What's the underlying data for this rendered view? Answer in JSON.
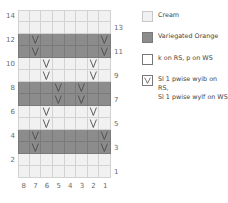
{
  "chart_data": {
    "type": "table",
    "columns": [
      8,
      7,
      6,
      5,
      4,
      3,
      2,
      1
    ],
    "rows_left_labels": [
      14,
      12,
      10,
      8,
      6,
      4,
      2
    ],
    "rows_right_labels": [
      13,
      11,
      9,
      7,
      5,
      3,
      1
    ],
    "row_colors": {
      "1": "cream",
      "2": "cream",
      "3": "orange",
      "4": "orange",
      "5": "cream",
      "6": "cream",
      "7": "orange",
      "8": "orange",
      "9": "cream",
      "10": "cream",
      "11": "orange",
      "12": "orange",
      "13": "cream",
      "14": "cream"
    },
    "slip_stitches": {
      "3": [
        7,
        1
      ],
      "4": [
        7,
        1
      ],
      "5": [
        6,
        2
      ],
      "6": [
        6,
        2
      ],
      "7": [
        5,
        3
      ],
      "8": [
        5,
        3
      ],
      "9": [
        6,
        2
      ],
      "10": [
        6,
        2
      ],
      "11": [
        7,
        1
      ],
      "12": [
        7,
        1
      ]
    }
  },
  "colors": {
    "cream": "#f1f1f1",
    "orange": "#8c8c8c",
    "grid": "#d2d2d2"
  },
  "axis": {
    "left": [
      "14",
      "12",
      "10",
      "8",
      "6",
      "4",
      "2"
    ],
    "right": [
      "13",
      "11",
      "9",
      "7",
      "5",
      "3",
      "1"
    ],
    "bottom": [
      "8",
      "7",
      "6",
      "5",
      "4",
      "3",
      "2",
      "1"
    ]
  },
  "legend": {
    "cream": "Cream",
    "orange": "Variegated Orange",
    "knit": "k on RS, p on WS",
    "slip_line1": "Sl 1 pwise wyib on RS,",
    "slip_line2": "Sl 1 pwise wylf on WS"
  }
}
